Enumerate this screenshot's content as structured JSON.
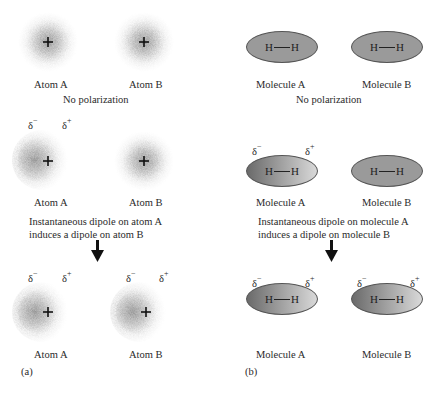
{
  "panel_a": {
    "panel_label": "(a)",
    "row1": {
      "atom_a": "Atom A",
      "atom_b": "Atom B",
      "caption": "No polarization"
    },
    "row2": {
      "atom_a": "Atom A",
      "atom_b": "Atom B",
      "caption_line1": "Instantaneous dipole on atom A",
      "caption_line2": "induces a dipole on atom B",
      "delta_minus": "δ",
      "minus": "−",
      "delta_plus": "δ",
      "plus": "+"
    },
    "row3": {
      "atom_a": "Atom A",
      "atom_b": "Atom B",
      "delta_minus": "δ",
      "minus": "−",
      "delta_plus": "δ",
      "plus": "+"
    },
    "nucleus_symbol": "+"
  },
  "panel_b": {
    "panel_label": "(b)",
    "atom_symbol": "H",
    "row1": {
      "mol_a": "Molecule A",
      "mol_b": "Molecule B",
      "caption": "No polarization"
    },
    "row2": {
      "mol_a": "Molecule A",
      "mol_b": "Molecule B",
      "caption_line1": "Instantaneous dipole on molecule A",
      "caption_line2": "induces a dipole on molecule B",
      "delta_minus": "δ",
      "minus": "−",
      "delta_plus": "δ",
      "plus": "+"
    },
    "row3": {
      "mol_a": "Molecule A",
      "mol_b": "Molecule B",
      "delta_minus": "δ",
      "minus": "−",
      "delta_plus": "δ",
      "plus": "+"
    }
  },
  "colors": {
    "cloud": "#8a8a8a",
    "neutral_fill": "#9a9a9a",
    "polar_dark": "#6a6a6a",
    "polar_light": "#d9d9d9",
    "arrow": "#111111"
  }
}
